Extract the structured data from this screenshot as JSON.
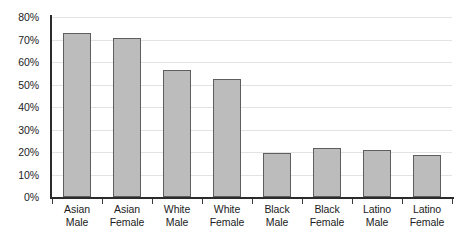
{
  "chart_data": {
    "type": "bar",
    "title": "",
    "subtitle": "",
    "xlabel": "",
    "ylabel": "",
    "categories": [
      "Asian Male",
      "Asian Female",
      "White Male",
      "White Female",
      "Black Male",
      "Black Female",
      "Latino Male",
      "Latino Female"
    ],
    "category_lines": [
      [
        "Asian",
        "Male"
      ],
      [
        "Asian",
        "Female"
      ],
      [
        "White",
        "Male"
      ],
      [
        "White",
        "Female"
      ],
      [
        "Black",
        "Male"
      ],
      [
        "Black",
        "Female"
      ],
      [
        "Latino",
        "Male"
      ],
      [
        "Latino",
        "Female"
      ]
    ],
    "values": [
      73,
      70.5,
      56.5,
      52.5,
      19.5,
      22,
      21,
      18.5
    ],
    "ylim": [
      0,
      80
    ],
    "ytick_labels": [
      "80%",
      "70%",
      "60%",
      "50%",
      "40%",
      "30%",
      "20%",
      "10%",
      "0%"
    ],
    "ytick_values": [
      80,
      70,
      60,
      50,
      40,
      30,
      20,
      10,
      0
    ],
    "grid": true,
    "legend": false,
    "legend_position": "none",
    "bar_color": "#bcbcbc",
    "bar_border_color": "#5e5e5e",
    "gridline_color": "#e3e3e3",
    "axis_color": "#2b2b2b",
    "background_color": "#ffffff",
    "text_color": "#1c1c1c"
  }
}
